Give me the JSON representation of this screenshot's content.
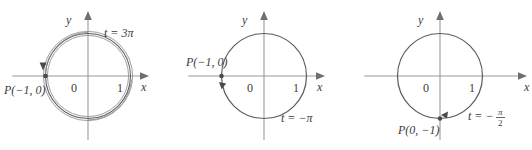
{
  "figure": {
    "type": "math-diagram",
    "panels": [
      {
        "id": "panel-1",
        "parameter_label": "t = 3π",
        "parameter_value": "3π",
        "point_label": "P(−1, 0)",
        "point_coords": [
          -1,
          0
        ],
        "axis_x_label": "x",
        "axis_y_label": "y",
        "origin_label": "0",
        "tick_label": "1",
        "revolutions": 1.5,
        "direction": "counterclockwise",
        "wrap_style": "spiral"
      },
      {
        "id": "panel-2",
        "parameter_label": "t = −π",
        "parameter_value": "−π",
        "point_label": "P(−1, 0)",
        "point_coords": [
          -1,
          0
        ],
        "axis_x_label": "x",
        "axis_y_label": "y",
        "origin_label": "0",
        "tick_label": "1",
        "revolutions": 0.5,
        "direction": "clockwise",
        "wrap_style": "single"
      },
      {
        "id": "panel-3",
        "parameter_label": "t = −",
        "parameter_numerator": "π",
        "parameter_denominator": "2",
        "parameter_value": "−π/2",
        "point_label": "P(0, −1)",
        "point_coords": [
          0,
          -1
        ],
        "axis_x_label": "x",
        "axis_y_label": "y",
        "origin_label": "0",
        "tick_label": "1",
        "revolutions": 0.25,
        "direction": "clockwise",
        "wrap_style": "single"
      }
    ],
    "colors": {
      "background": "#ffffff",
      "axis": "#9a9a9a",
      "circle": "#5c5c5c",
      "spiral": "#8d8d8d",
      "text": "#3b3b3b",
      "marker": "#4a4a4a"
    }
  }
}
